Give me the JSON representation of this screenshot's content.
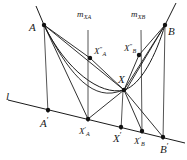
{
  "figure": {
    "background_color": "#ffffff",
    "stroke_color": "#1a1a1a",
    "vertex_color": "#111111",
    "width": 187,
    "height": 160
  },
  "labels": {
    "point_A": "A",
    "point_B": "B",
    "axis_line": "l",
    "m_xa": "m",
    "m_xa_sub": "XA",
    "m_xb": "m",
    "m_xb_sub": "XB",
    "x_double_prime_a": "X",
    "x_double_prime_a_sup": "″",
    "x_double_prime_a_sub": "A",
    "x_double_prime_b": "X",
    "x_double_prime_b_sup": "″",
    "x_double_prime_b_sub": "B",
    "point_X": "X",
    "a_prime": "A",
    "a_prime_sup": "′",
    "x_prime_a": "X",
    "x_prime_a_sup": "′",
    "x_prime_a_sub": "A",
    "x_prime": "X",
    "x_prime_sup": "′",
    "x_prime_b": "X",
    "x_prime_b_sup": "′",
    "x_prime_b_sub": "B",
    "b_prime": "B",
    "b_prime_sup": "′"
  },
  "geometry": {
    "points": {
      "A": {
        "x": 44,
        "y": 25
      },
      "B": {
        "x": 165,
        "y": 25
      },
      "XaDP": {
        "x": 90,
        "y": 58
      },
      "XbDP": {
        "x": 139,
        "y": 55
      },
      "X": {
        "x": 124,
        "y": 90
      },
      "Apr": {
        "x": 48,
        "y": 110
      },
      "XaP": {
        "x": 88,
        "y": 119
      },
      "Xpr": {
        "x": 121,
        "y": 127
      },
      "XbPr": {
        "x": 142,
        "y": 131
      },
      "Bpr": {
        "x": 163,
        "y": 137
      }
    },
    "axis": {
      "x1": 8,
      "y1": 100,
      "x2": 185,
      "y2": 143
    }
  }
}
